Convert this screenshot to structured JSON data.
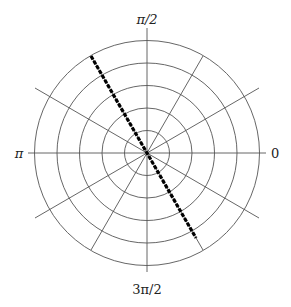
{
  "diagram": {
    "type": "polar_grid",
    "labels": {
      "right": "0",
      "top": "π/2",
      "left": "π",
      "bottom": "3π/2"
    },
    "rings": 5,
    "radial_spokes_deg": [
      0,
      30,
      60,
      90,
      120,
      150
    ],
    "highlighted_line": {
      "angle": "2π/3",
      "style": "dashed",
      "color": "#000000"
    },
    "grid_color": "#555555"
  }
}
